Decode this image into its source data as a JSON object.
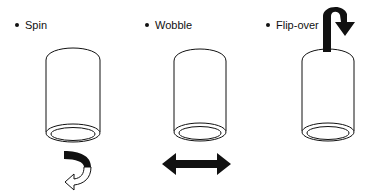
{
  "diagram": {
    "panels": [
      {
        "label": "Spin",
        "motion_icon": "curved-rotate-arrow-icon"
      },
      {
        "label": "Wobble",
        "motion_icon": "double-horizontal-arrow-icon"
      },
      {
        "label": "Flip-over",
        "motion_icon": "flip-over-hook-arrow-icon"
      }
    ],
    "colors": {
      "stroke": "#111111",
      "background": "#ffffff"
    }
  }
}
